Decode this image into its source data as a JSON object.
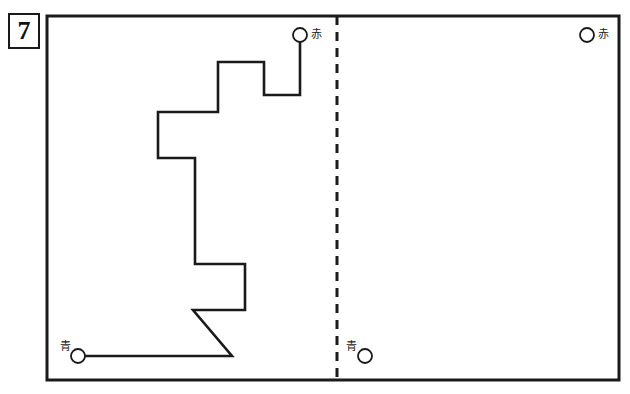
{
  "page": {
    "width": 630,
    "height": 394,
    "background": "#ffffff",
    "ink": "#1a1a1a"
  },
  "question": {
    "number": "7"
  },
  "frame": {
    "x": 47,
    "y": 16,
    "width": 572,
    "height": 364,
    "stroke_width": 3
  },
  "fold_line": {
    "name": "dashed-fold-line",
    "x": 337,
    "y_top": 16,
    "y_bottom": 380,
    "dash": "9 7",
    "stroke_width": 3
  },
  "terminals": [
    {
      "id": "red-start",
      "label": "赤",
      "label_reading": "aka",
      "label_meaning": "red",
      "cx": 300,
      "cy": 35,
      "r": 7,
      "label_x": 311,
      "label_y": 29
    },
    {
      "id": "red-target",
      "label": "赤",
      "label_reading": "aka",
      "label_meaning": "red",
      "cx": 587,
      "cy": 35,
      "r": 7,
      "label_x": 598,
      "label_y": 29
    },
    {
      "id": "blue-start",
      "label": "青",
      "label_reading": "ao",
      "label_meaning": "blue",
      "cx": 78,
      "cy": 356,
      "r": 7,
      "label_x": 60,
      "label_y": 341
    },
    {
      "id": "blue-target",
      "label": "青",
      "label_reading": "ao",
      "label_meaning": "blue",
      "cx": 365,
      "cy": 356,
      "r": 7,
      "label_x": 346,
      "label_y": 341
    }
  ],
  "polyline": {
    "name": "drawn-wire-path",
    "stroke_width": 2.6,
    "points": "300,42 300,95 264,95 264,62 218,62 218,112 158,112 158,158 195,158 195,264 245,264 245,310 193,310 232,356 85,356"
  }
}
